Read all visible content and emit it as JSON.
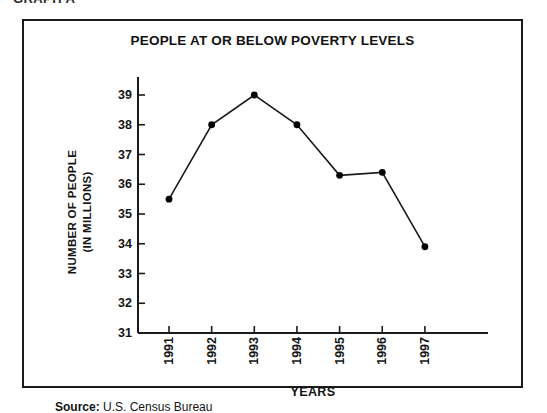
{
  "figure": {
    "clipped_top_label": "GRAPH A",
    "source_label": "Source:",
    "source_value": "U.S. Census Bureau",
    "frame_color": "#1a1a1a",
    "background_color": "#ffffff"
  },
  "chart_data": {
    "type": "line",
    "title": "PEOPLE AT OR BELOW POVERTY LEVELS",
    "xlabel": "YEARS",
    "ylabel": "NUMBER OF PEOPLE\n(IN MILLIONS)",
    "ylabel_line1": "NUMBER OF PEOPLE",
    "ylabel_line2": "(IN MILLIONS)",
    "categories": [
      "1991",
      "1992",
      "1993",
      "1994",
      "1995",
      "1996",
      "1997"
    ],
    "values": [
      35.5,
      38.0,
      39.0,
      38.0,
      36.3,
      36.4,
      33.9
    ],
    "ylim": [
      31,
      39
    ],
    "yticks": [
      31,
      32,
      33,
      34,
      35,
      36,
      37,
      38,
      39
    ],
    "ytick_labels": [
      "31",
      "32",
      "33",
      "34",
      "35",
      "36",
      "37",
      "38",
      "39"
    ],
    "grid": false,
    "legend": false,
    "series_color": "#1a1a1a",
    "marker": "filled-circle",
    "marker_color": "#000000"
  }
}
